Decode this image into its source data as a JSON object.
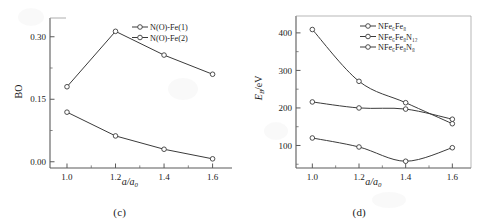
{
  "figure": {
    "background": "#ffffff",
    "line_color": "#3b3b3b",
    "marker_fill": "#ffffff"
  },
  "panel_c": {
    "caption": "(c)",
    "xlabel": "a/a",
    "xlabel_sub": "0",
    "ylabel": "BO",
    "xticks": [
      "1.0",
      "1.2",
      "1.4",
      "1.6"
    ],
    "yticks": [
      "0.00",
      "0.15",
      "0.30"
    ],
    "legend": [
      {
        "label": "N(O)-Fe(1)"
      },
      {
        "label": "N(O)-Fe(2)"
      }
    ]
  },
  "panel_d": {
    "caption": "(d)",
    "xlabel": "a/a",
    "xlabel_sub": "0",
    "ylabel_main": "E",
    "ylabel_sub": "B",
    "ylabel_unit": "/eV",
    "xticks": [
      "1.0",
      "1.2",
      "1.4",
      "1.6"
    ],
    "yticks": [
      "100",
      "200",
      "300",
      "400"
    ],
    "legend": [
      {
        "label": "NFe6Fe8",
        "display": "NFe₆Fe₈"
      },
      {
        "label": "NFe6Fe8N12",
        "display": "NFe₆Fe₈N₁₂"
      },
      {
        "label": "NFe6Fe8N8",
        "display": "NFe₆Fe₈N₈"
      }
    ]
  },
  "chart_data": [
    {
      "type": "line",
      "panel": "(c)",
      "title": "",
      "xlabel": "a/a0",
      "ylabel": "BO",
      "x": [
        1.0,
        1.2,
        1.4,
        1.6
      ],
      "xlim": [
        0.93,
        1.68
      ],
      "ylim": [
        -0.015,
        0.345
      ],
      "xticks": [
        1.0,
        1.2,
        1.4,
        1.6
      ],
      "yticks": [
        0.0,
        0.15,
        0.3
      ],
      "grid": false,
      "legend_position": "top-right",
      "marker": "open-circle",
      "series": [
        {
          "name": "N(O)-Fe(1)",
          "values": [
            0.18,
            0.313,
            0.256,
            0.21
          ]
        },
        {
          "name": "N(O)-Fe(2)",
          "values": [
            0.119,
            0.062,
            0.03,
            0.007
          ]
        }
      ]
    },
    {
      "type": "line",
      "panel": "(d)",
      "title": "",
      "xlabel": "a/a0",
      "ylabel": "EB/eV",
      "x": [
        1.0,
        1.2,
        1.4,
        1.6
      ],
      "xlim": [
        0.93,
        1.68
      ],
      "ylim": [
        40,
        445
      ],
      "xticks": [
        1.0,
        1.2,
        1.4,
        1.6
      ],
      "yticks": [
        100,
        200,
        300,
        400
      ],
      "grid": false,
      "legend_position": "top-right",
      "marker": "open-circle",
      "series": [
        {
          "name": "NFe6Fe8",
          "values": [
            409,
            271,
            214,
            158
          ]
        },
        {
          "name": "NFe6Fe8N12",
          "values": [
            216,
            200,
            197,
            170
          ]
        },
        {
          "name": "NFe6Fe8N8",
          "values": [
            120,
            96,
            58,
            94
          ]
        }
      ]
    }
  ]
}
